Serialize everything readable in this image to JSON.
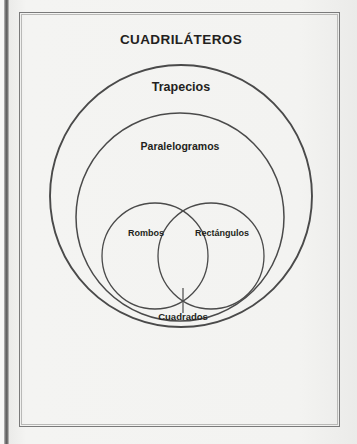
{
  "figure": {
    "title": "CUADRILÁTEROS",
    "kind": "euler-venn-diagram"
  },
  "sets": {
    "outer": {
      "label": "CUADRILÁTEROS",
      "shape": "rectangle"
    },
    "trapecios": {
      "label": "Trapecios",
      "shape": "circle",
      "cx": 181,
      "cy": 196,
      "r": 131
    },
    "paralelogramos": {
      "label": "Paralelogramos",
      "shape": "circle",
      "cx": 180,
      "cy": 217,
      "r": 104
    },
    "rombos": {
      "label": "Rombos",
      "shape": "circle",
      "cx": 155,
      "cy": 256,
      "r": 53
    },
    "rectangulos": {
      "label": "Rectángulos",
      "shape": "circle",
      "cx": 211,
      "cy": 256,
      "r": 53
    },
    "cuadrados": {
      "label": "Cuadrados",
      "shape": "intersection",
      "of": [
        "rombos",
        "rectangulos"
      ]
    }
  },
  "colors": {
    "background": "#f2f2f0",
    "stroke": "#4a4a4a",
    "frame_stroke": "#7a7a7a",
    "text": "#231f20"
  }
}
